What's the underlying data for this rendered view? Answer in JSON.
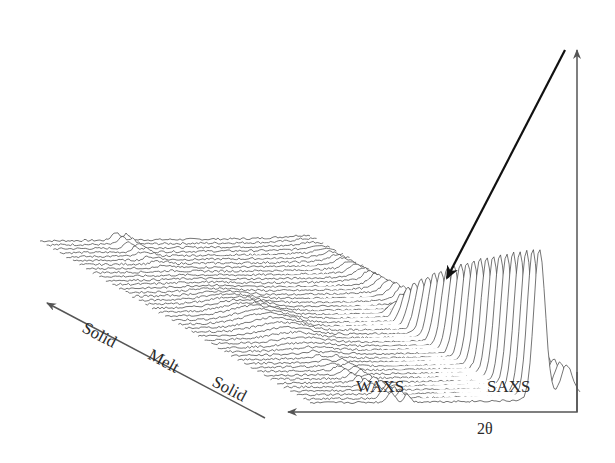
{
  "figure": {
    "colors": {
      "background": "#ffffff",
      "trace": "#3a3a3a",
      "axis": "#555555",
      "annotation_arrow": "#111111",
      "text": "#2a2a2a"
    }
  },
  "labels": {
    "time_axis": [
      "Solid",
      "Melt",
      "Solid"
    ],
    "regions": {
      "waxs": "WAXS",
      "saxs": "SAXS"
    },
    "x_axis": "2θ"
  },
  "axes": {
    "vertical_arrow": {
      "x": 577,
      "y_top": 50,
      "y_bottom": 412
    },
    "two_theta_arrow": {
      "x_start": 577,
      "x_end": 288,
      "y": 412
    },
    "time_arrow": {
      "x1": 265,
      "y1": 418,
      "x2": 47,
      "y2": 303
    },
    "annotation_arrow": {
      "x1": 565,
      "y1": 50,
      "x2": 447,
      "y2": 278
    }
  },
  "waterfall": {
    "n_traces": 42,
    "front_baseline": {
      "x": 310,
      "y": 405
    },
    "back_baseline": {
      "x": 40,
      "y": 243
    },
    "trace_width": 270,
    "phases": [
      "solid",
      "solid",
      "solid",
      "solid",
      "solid",
      "solid",
      "solid",
      "solid",
      "solid",
      "solid",
      "solid",
      "solid",
      "solid",
      "solid",
      "melt",
      "melt",
      "melt",
      "melt",
      "melt",
      "melt",
      "melt",
      "melt",
      "melt",
      "melt",
      "melt",
      "melt",
      "melt",
      "melt",
      "solid",
      "solid",
      "solid",
      "solid",
      "solid",
      "solid",
      "solid",
      "solid",
      "solid",
      "solid",
      "solid",
      "solid",
      "solid",
      "solid"
    ]
  }
}
